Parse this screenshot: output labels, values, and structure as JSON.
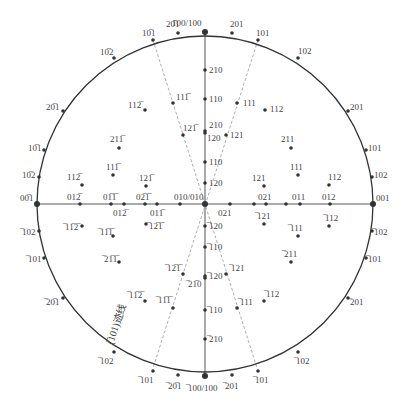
{
  "diagram": {
    "type": "stereographic-projection",
    "circle": {
      "cx": 205,
      "cy": 204,
      "r": 168,
      "stroke": "#333333"
    },
    "axes": {
      "vertical": {
        "x1": 205,
        "y1": 32,
        "x2": 205,
        "y2": 376,
        "stroke": "#aaaaaa"
      },
      "horizontal": {
        "x1": 37,
        "y1": 204,
        "x2": 373,
        "y2": 204,
        "stroke": "#aaaaaa"
      }
    },
    "zone_lines": [
      {
        "x1": 153,
        "y1": 40,
        "x2": 257,
        "y2": 368
      },
      {
        "x1": 258,
        "y1": 40,
        "x2": 153,
        "y2": 368
      }
    ],
    "zone_label": "(̅101)迹线",
    "poles": [
      {
        "x": 205,
        "y": 32,
        "label": "100/100",
        "lx": 172,
        "ly": 26,
        "big": true
      },
      {
        "x": 178,
        "y": 33,
        "label": "20̅1",
        "lx": 166,
        "ly": 27
      },
      {
        "x": 232,
        "y": 33,
        "label": "201",
        "lx": 230,
        "ly": 27
      },
      {
        "x": 153,
        "y": 40,
        "label": "10̅1",
        "lx": 142,
        "ly": 36
      },
      {
        "x": 258,
        "y": 40,
        "label": "101",
        "lx": 256,
        "ly": 36
      },
      {
        "x": 114,
        "y": 58,
        "label": "10̅2",
        "lx": 100,
        "ly": 55
      },
      {
        "x": 298,
        "y": 58,
        "label": "102",
        "lx": 298,
        "ly": 54
      },
      {
        "x": 63,
        "y": 111,
        "label": "20̅1",
        "lx": 46,
        "ly": 110
      },
      {
        "x": 348,
        "y": 111,
        "label": "201",
        "lx": 350,
        "ly": 110
      },
      {
        "x": 44,
        "y": 150,
        "label": "10̅1",
        "lx": 28,
        "ly": 151
      },
      {
        "x": 366,
        "y": 150,
        "label": "101",
        "lx": 368,
        "ly": 151
      },
      {
        "x": 39,
        "y": 177,
        "label": "10̅2",
        "lx": 22,
        "ly": 178
      },
      {
        "x": 372,
        "y": 177,
        "label": "102",
        "lx": 374,
        "ly": 178
      },
      {
        "x": 37,
        "y": 204,
        "label": "00̅1",
        "lx": 20,
        "ly": 201,
        "big": true
      },
      {
        "x": 373,
        "y": 204,
        "label": "001",
        "lx": 376,
        "ly": 201,
        "big": true
      },
      {
        "x": 39,
        "y": 231,
        "label": "̅102",
        "lx": 22,
        "ly": 235
      },
      {
        "x": 372,
        "y": 231,
        "label": "̅102",
        "lx": 374,
        "ly": 235
      },
      {
        "x": 44,
        "y": 258,
        "label": "̅101",
        "lx": 28,
        "ly": 262
      },
      {
        "x": 366,
        "y": 258,
        "label": "̅101",
        "lx": 368,
        "ly": 262
      },
      {
        "x": 63,
        "y": 298,
        "label": "̅20̅1",
        "lx": 46,
        "ly": 305
      },
      {
        "x": 348,
        "y": 298,
        "label": "̅201",
        "lx": 350,
        "ly": 305
      },
      {
        "x": 114,
        "y": 352,
        "label": "̅102",
        "lx": 100,
        "ly": 364
      },
      {
        "x": 298,
        "y": 352,
        "label": "̅102",
        "lx": 296,
        "ly": 364
      },
      {
        "x": 153,
        "y": 371,
        "label": "̅101",
        "lx": 140,
        "ly": 383
      },
      {
        "x": 258,
        "y": 371,
        "label": "̅101",
        "lx": 255,
        "ly": 383
      },
      {
        "x": 178,
        "y": 375,
        "label": "̅20̅1",
        "lx": 168,
        "ly": 389
      },
      {
        "x": 232,
        "y": 375,
        "label": "̅201",
        "lx": 225,
        "ly": 389
      },
      {
        "x": 205,
        "y": 376,
        "label": "̅100/100",
        "lx": 188,
        "ly": 391,
        "big": true
      },
      {
        "x": 205,
        "y": 70,
        "label": "210",
        "lx": 209,
        "ly": 73
      },
      {
        "x": 205,
        "y": 99,
        "label": "110",
        "lx": 209,
        "ly": 102
      },
      {
        "x": 205,
        "y": 131,
        "label": "210",
        "lx": 209,
        "ly": 128
      },
      {
        "x": 205,
        "y": 133,
        "label": "120",
        "lx": 207,
        "ly": 141
      },
      {
        "x": 205,
        "y": 162,
        "label": "110",
        "lx": 209,
        "ly": 165
      },
      {
        "x": 205,
        "y": 183,
        "label": "120",
        "lx": 209,
        "ly": 186
      },
      {
        "x": 205,
        "y": 204,
        "label": "010/010",
        "lx": 174,
        "ly": 200,
        "big": true
      },
      {
        "x": 205,
        "y": 226,
        "label": "̅120",
        "lx": 209,
        "ly": 229
      },
      {
        "x": 205,
        "y": 247,
        "label": "̅110",
        "lx": 209,
        "ly": 250
      },
      {
        "x": 205,
        "y": 276,
        "label": "̅120",
        "lx": 209,
        "ly": 279
      },
      {
        "x": 205,
        "y": 278,
        "label": "̅21̅0",
        "lx": 188,
        "ly": 287
      },
      {
        "x": 205,
        "y": 310,
        "label": "̅110",
        "lx": 209,
        "ly": 313
      },
      {
        "x": 205,
        "y": 339,
        "label": "̅210",
        "lx": 209,
        "ly": 342
      },
      {
        "x": 80,
        "y": 204,
        "label": "012̅",
        "lx": 67,
        "ly": 200
      },
      {
        "x": 111,
        "y": 204,
        "label": "01̅1̅",
        "lx": 103,
        "ly": 200
      },
      {
        "x": 124,
        "y": 204,
        "label": "012̅",
        "lx": 113,
        "ly": 216
      },
      {
        "x": 145,
        "y": 204,
        "label": "02̅1̅",
        "lx": 136,
        "ly": 200
      },
      {
        "x": 157,
        "y": 204,
        "label": "011̅",
        "lx": 150,
        "ly": 216
      },
      {
        "x": 180,
        "y": 204,
        "label": "",
        "lx": 0,
        "ly": 0
      },
      {
        "x": 230,
        "y": 204,
        "label": "021",
        "lx": 218,
        "ly": 216
      },
      {
        "x": 254,
        "y": 204,
        "label": "",
        "lx": 0,
        "ly": 0
      },
      {
        "x": 266,
        "y": 204,
        "label": "021",
        "lx": 258,
        "ly": 200
      },
      {
        "x": 286,
        "y": 204,
        "label": "",
        "lx": 0,
        "ly": 0
      },
      {
        "x": 300,
        "y": 204,
        "label": "011",
        "lx": 292,
        "ly": 200
      },
      {
        "x": 330,
        "y": 204,
        "label": "012",
        "lx": 322,
        "ly": 200
      },
      {
        "x": 145,
        "y": 110,
        "label": "112̅",
        "lx": 128,
        "ly": 108
      },
      {
        "x": 173,
        "y": 103,
        "label": "111̅",
        "lx": 176,
        "ly": 100
      },
      {
        "x": 119,
        "y": 148,
        "label": "211̅",
        "lx": 110,
        "ly": 142
      },
      {
        "x": 113,
        "y": 175,
        "label": "111̅",
        "lx": 106,
        "ly": 170
      },
      {
        "x": 82,
        "y": 185,
        "label": "112̅",
        "lx": 67,
        "ly": 180
      },
      {
        "x": 146,
        "y": 186,
        "label": "121̅",
        "lx": 139,
        "ly": 181
      },
      {
        "x": 183,
        "y": 135,
        "label": "121̅",
        "lx": 183,
        "ly": 131
      },
      {
        "x": 237,
        "y": 103,
        "label": "111",
        "lx": 243,
        "ly": 106
      },
      {
        "x": 265,
        "y": 110,
        "label": "112",
        "lx": 270,
        "ly": 112
      },
      {
        "x": 291,
        "y": 148,
        "label": "211",
        "lx": 281,
        "ly": 142
      },
      {
        "x": 298,
        "y": 175,
        "label": "111",
        "lx": 290,
        "ly": 170
      },
      {
        "x": 329,
        "y": 185,
        "label": "112",
        "lx": 328,
        "ly": 180
      },
      {
        "x": 264,
        "y": 186,
        "label": "121",
        "lx": 252,
        "ly": 181
      },
      {
        "x": 226,
        "y": 135,
        "label": "121",
        "lx": 230,
        "ly": 138
      },
      {
        "x": 82,
        "y": 226,
        "label": "̅11̅2̅",
        "lx": 65,
        "ly": 230
      },
      {
        "x": 146,
        "y": 224,
        "label": "̅12̅1̅",
        "lx": 149,
        "ly": 229
      },
      {
        "x": 113,
        "y": 236,
        "label": "̅11̅1̅",
        "lx": 100,
        "ly": 235
      },
      {
        "x": 119,
        "y": 262,
        "label": "̅21̅1̅",
        "lx": 104,
        "ly": 262
      },
      {
        "x": 183,
        "y": 274,
        "label": "̅12̅1̅",
        "lx": 167,
        "ly": 271
      },
      {
        "x": 145,
        "y": 301,
        "label": "̅11̅2̅",
        "lx": 129,
        "ly": 298
      },
      {
        "x": 173,
        "y": 308,
        "label": "̅11̅1̅",
        "lx": 158,
        "ly": 303
      },
      {
        "x": 264,
        "y": 224,
        "label": "̅121",
        "lx": 257,
        "ly": 219
      },
      {
        "x": 298,
        "y": 236,
        "label": "̅111",
        "lx": 290,
        "ly": 231
      },
      {
        "x": 329,
        "y": 226,
        "label": "̅112",
        "lx": 325,
        "ly": 221
      },
      {
        "x": 291,
        "y": 262,
        "label": "̅211",
        "lx": 284,
        "ly": 257
      },
      {
        "x": 226,
        "y": 274,
        "label": "̅121",
        "lx": 231,
        "ly": 271
      },
      {
        "x": 264,
        "y": 301,
        "label": "̅112",
        "lx": 266,
        "ly": 297
      },
      {
        "x": 237,
        "y": 308,
        "label": "̅111",
        "lx": 240,
        "ly": 305
      }
    ]
  }
}
